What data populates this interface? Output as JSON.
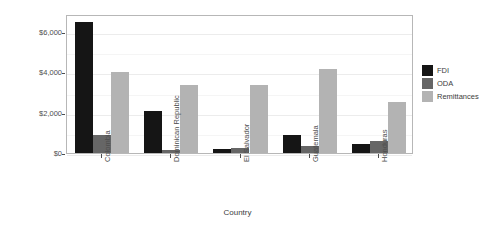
{
  "chart_data": {
    "type": "bar",
    "title": "",
    "xlabel": "Country",
    "ylabel": "Millions of US$",
    "categories": [
      "Colombia",
      "Dominican Republic",
      "El Salvador",
      "Guatemala",
      "Honduras"
    ],
    "series": [
      {
        "name": "FDI",
        "color": "#151515",
        "values": [
          6500,
          2100,
          200,
          900,
          450
        ]
      },
      {
        "name": "ODA",
        "color": "#666666",
        "values": [
          900,
          130,
          250,
          350,
          600
        ]
      },
      {
        "name": "Remittances",
        "color": "#b3b3b3",
        "values": [
          4000,
          3400,
          3400,
          4150,
          2550
        ]
      }
    ],
    "ylim": [
      0,
      6900
    ],
    "yticks": [
      0,
      2000,
      4000,
      6000
    ],
    "ytick_labels": [
      "$0",
      "$2,000",
      "$4,000",
      "$6,000"
    ],
    "grid": true,
    "legend_position": "right",
    "legend_title": ""
  }
}
